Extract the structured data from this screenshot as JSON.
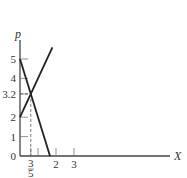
{
  "chart_data": {
    "type": "line",
    "title": "",
    "xlabel": "X",
    "ylabel": "p",
    "xlim": [
      0,
      8.5
    ],
    "ylim": [
      0,
      6.3
    ],
    "grid": false,
    "x_ticks": [
      {
        "value": 0.6,
        "label_num": "3",
        "label_den": "5"
      },
      {
        "value": 1,
        "label": ""
      },
      {
        "value": 2,
        "label": "2"
      },
      {
        "value": 3,
        "label": "3"
      }
    ],
    "y_ticks": [
      {
        "value": 0,
        "label": "0"
      },
      {
        "value": 1,
        "label": "1"
      },
      {
        "value": 2,
        "label": "2"
      },
      {
        "value": 3.2,
        "label": "3.2"
      },
      {
        "value": 4,
        "label": "4"
      },
      {
        "value": 5,
        "label": "5"
      }
    ],
    "series": [
      {
        "name": "demand",
        "x": [
          0,
          1.6667
        ],
        "y": [
          5,
          0
        ]
      },
      {
        "name": "supply",
        "x": [
          0,
          1.8
        ],
        "y": [
          2,
          5.6
        ]
      }
    ],
    "annotations": [
      {
        "type": "intersection",
        "x": 0.6,
        "y": 3.2,
        "dashed_guides": true
      }
    ]
  }
}
